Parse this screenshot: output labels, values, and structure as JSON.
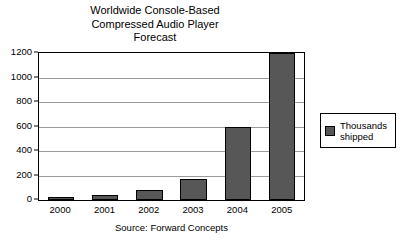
{
  "chart_data": {
    "type": "bar",
    "title": "Worldwide Console-Based Compressed Audio Player Forecast",
    "title_lines": [
      "Worldwide Console-Based",
      "Compressed Audio Player",
      "Forecast"
    ],
    "categories": [
      "2000",
      "2001",
      "2002",
      "2003",
      "2004",
      "2005"
    ],
    "values": [
      25,
      40,
      85,
      170,
      600,
      1200
    ],
    "series": [
      {
        "name": "Thousands shipped",
        "values": [
          25,
          40,
          85,
          170,
          600,
          1200
        ]
      }
    ],
    "xlabel": "",
    "ylabel": "",
    "ylim": [
      0,
      1200
    ],
    "yticks": [
      0,
      200,
      400,
      600,
      800,
      1000,
      1200
    ],
    "ytick_labels": [
      "0",
      "200",
      "400",
      "600",
      "800",
      "1000",
      "1200"
    ],
    "grid": true,
    "legend_position": "right",
    "legend_entries": [
      "Thousands shipped"
    ],
    "annotation": "Source: Forward Concepts",
    "colors": {
      "bar_fill": "#575757",
      "bar_border": "#000000",
      "gridline": "#9a9a9a",
      "frame": "#000000",
      "background": "#ffffff",
      "text": "#000000"
    }
  },
  "legend": {
    "label_line1": "Thousands",
    "label_line2": "shipped"
  }
}
